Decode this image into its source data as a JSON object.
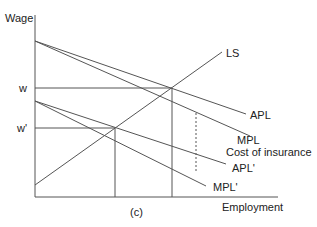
{
  "diagram": {
    "caption": "(c)",
    "axes": {
      "y_label": "Wage",
      "x_label": "Employment"
    },
    "wage_levels": {
      "w": "w",
      "w_prime": "w'"
    },
    "curves": {
      "ls": "LS",
      "apl": "APL",
      "mpl": "MPL",
      "apl_prime": "APL'",
      "mpl_prime": "MPL'"
    },
    "annotations": {
      "cost_of_insurance": "Cost of insurance"
    },
    "colors": {
      "line": "#555555",
      "text": "#222222",
      "background": "#ffffff"
    }
  }
}
